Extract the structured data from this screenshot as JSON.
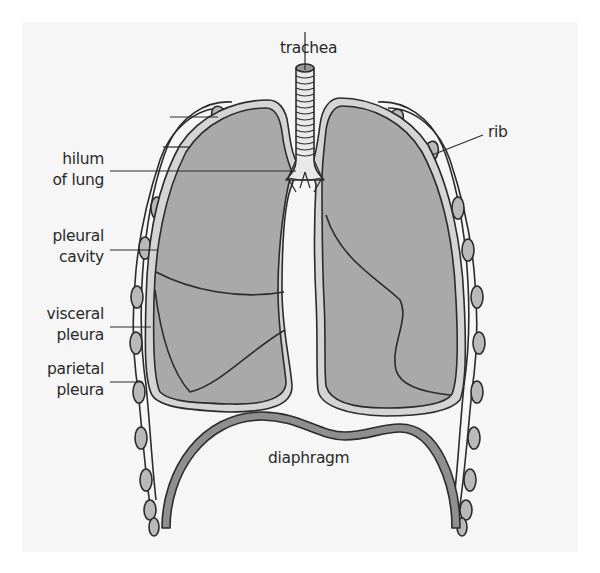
{
  "diagram": {
    "type": "anatomy",
    "colors": {
      "background": "#f6f6f6",
      "lung_fill": "#a9a9a9",
      "pleura_fill": "#d4d4d4",
      "rib_fill": "#b9b9b9",
      "diaphragm_fill": "#8f8f8f",
      "outline": "#2b2b2b"
    }
  },
  "labels": {
    "trachea": "trachea",
    "rib": "rib",
    "hilum_line1": "hilum",
    "hilum_line2": "of lung",
    "pleural_cavity_line1": "pleural",
    "pleural_cavity_line2": "cavity",
    "visceral_pleura_line1": "visceral",
    "visceral_pleura_line2": "pleura",
    "parietal_pleura_line1": "parietal",
    "parietal_pleura_line2": "pleura",
    "diaphragm": "diaphragm"
  }
}
